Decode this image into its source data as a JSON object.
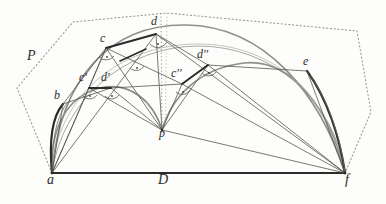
{
  "figure": {
    "background_color": "#fdfdfb",
    "ink_color": "#2b2b2b",
    "gray_color": "#8a8a88",
    "dotted_color": "#9a9a98",
    "canvas": {
      "width": 386,
      "height": 204
    }
  },
  "labels": [
    {
      "id": "P",
      "text": "P",
      "x": 27,
      "y": 55,
      "size": "big"
    },
    {
      "id": "a",
      "text": "a",
      "x": 47,
      "y": 180,
      "size": "big"
    },
    {
      "id": "b",
      "text": "b",
      "x": 54,
      "y": 96,
      "size": "normal"
    },
    {
      "id": "c",
      "text": "c",
      "x": 100,
      "y": 39,
      "size": "normal"
    },
    {
      "id": "d",
      "text": "d",
      "x": 151,
      "y": 22,
      "size": "normal"
    },
    {
      "id": "cp",
      "text": "c'",
      "x": 80,
      "y": 78,
      "size": "normal"
    },
    {
      "id": "dp",
      "text": "d'",
      "x": 102,
      "y": 78,
      "size": "normal"
    },
    {
      "id": "cpp",
      "text": "c''",
      "x": 172,
      "y": 74,
      "size": "normal"
    },
    {
      "id": "dpp",
      "text": "d''",
      "x": 198,
      "y": 55,
      "size": "normal"
    },
    {
      "id": "e",
      "text": "e",
      "x": 303,
      "y": 62,
      "size": "normal"
    },
    {
      "id": "f",
      "text": "f",
      "x": 345,
      "y": 180,
      "size": "big"
    },
    {
      "id": "p",
      "text": "p",
      "x": 159,
      "y": 134,
      "size": "normal"
    },
    {
      "id": "D",
      "text": "D",
      "x": 158,
      "y": 180,
      "size": "big"
    }
  ],
  "points": {
    "a": {
      "x": 52,
      "y": 173
    },
    "f": {
      "x": 345,
      "y": 173
    },
    "p": {
      "x": 162,
      "y": 130
    },
    "b": {
      "x": 63,
      "y": 104
    },
    "c": {
      "x": 106,
      "y": 48
    },
    "d": {
      "x": 156,
      "y": 34
    },
    "cq": {
      "x": 89,
      "y": 88
    },
    "dq": {
      "x": 111,
      "y": 88
    },
    "cqq": {
      "x": 182,
      "y": 84
    },
    "dqq": {
      "x": 208,
      "y": 65
    },
    "e": {
      "x": 307,
      "y": 71
    }
  },
  "polygon_P": {
    "name": "dotted-bounding-polygon",
    "vertices": [
      {
        "x": 52,
        "y": 173
      },
      {
        "x": 17,
        "y": 88
      },
      {
        "x": 73,
        "y": 22
      },
      {
        "x": 167,
        "y": 13
      },
      {
        "x": 357,
        "y": 31
      },
      {
        "x": 371,
        "y": 112
      },
      {
        "x": 345,
        "y": 173
      }
    ]
  },
  "arcs": [
    {
      "name": "outer-arc-a-f",
      "style": "thin-gray"
    },
    {
      "name": "big-arc-a-d-f",
      "style": "gray"
    },
    {
      "name": "arc-a-b-p",
      "style": "gray"
    },
    {
      "name": "arc-p-dpp-f",
      "style": "gray"
    },
    {
      "name": "thick-arc-a-b",
      "style": "thick-dark"
    },
    {
      "name": "thick-arc-e-f",
      "style": "thick-dark"
    }
  ],
  "segments": [
    {
      "name": "baseline-a-f",
      "style": "thick-dark"
    },
    {
      "name": "chord-a-b",
      "style": "thin"
    },
    {
      "name": "chord-b-c",
      "style": "thin"
    },
    {
      "name": "chord-c-d",
      "style": "thick-dark"
    },
    {
      "name": "chord-d-p",
      "style": "thin"
    },
    {
      "name": "chord-a-c",
      "style": "thin"
    },
    {
      "name": "chord-a-d",
      "style": "thin"
    },
    {
      "name": "chord-p-cq",
      "style": "thin"
    },
    {
      "name": "chord-cq-dq",
      "style": "thick-dark"
    },
    {
      "name": "chord-cqq-dqq",
      "style": "thick-dark"
    },
    {
      "name": "chord-d-f",
      "style": "thin"
    },
    {
      "name": "chord-e-f",
      "style": "thin"
    },
    {
      "name": "chord-p-f",
      "style": "thin"
    },
    {
      "name": "vertical-d-p",
      "style": "dotted"
    }
  ],
  "angle_marks": [
    {
      "at": "c",
      "kind": "right-angle-dot"
    },
    {
      "at": "d",
      "kind": "right-angle-dot"
    },
    {
      "at": "cq",
      "kind": "right-angle-dot"
    },
    {
      "at": "dq",
      "kind": "right-angle-dot"
    },
    {
      "at": "cqq",
      "kind": "right-angle-dot"
    },
    {
      "at": "dqq",
      "kind": "right-angle-dot"
    },
    {
      "at": "mid",
      "kind": "right-angle-dot"
    }
  ]
}
